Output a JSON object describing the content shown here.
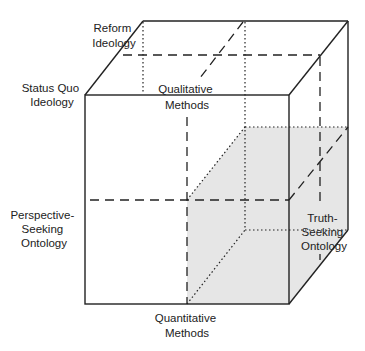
{
  "diagram": {
    "type": "3d-cube-framework",
    "colors": {
      "line": "#222222",
      "shade": "#e6e6e6",
      "background": "#ffffff"
    },
    "labels": {
      "reform_ideology": [
        "Reform",
        "Ideology"
      ],
      "status_quo_ideology": [
        "Status Quo",
        "Ideology"
      ],
      "qualitative_methods": [
        "Qualitative",
        "Methods"
      ],
      "perspective_seeking_ontology": [
        "Perspective-",
        "Seeking",
        "Ontology"
      ],
      "truth_seeking_ontology": [
        "Truth-",
        "Seeking",
        "Ontology"
      ],
      "quantitative_methods": [
        "Quantitative",
        "Methods"
      ]
    },
    "shaded_region": "Quantitative Methods × Truth-Seeking Ontology octant (lower-right)"
  }
}
